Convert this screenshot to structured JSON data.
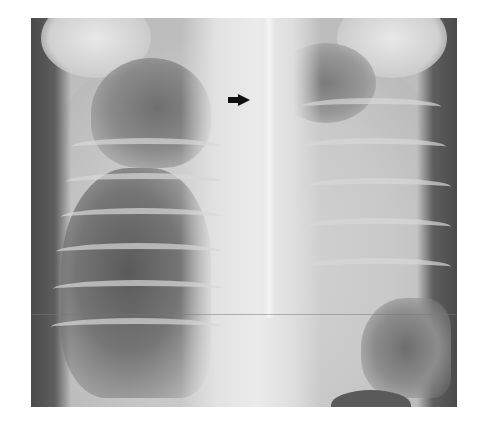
{
  "figure": {
    "type": "chest-radiograph",
    "view": "frontal",
    "annotations": [
      {
        "kind": "arrow",
        "direction": "right",
        "color": "#111111"
      }
    ],
    "colors": {
      "background": "#ffffff",
      "film_dark": "#4a4a4a",
      "film_light": "#ebebeb",
      "arrow": "#111111"
    }
  }
}
